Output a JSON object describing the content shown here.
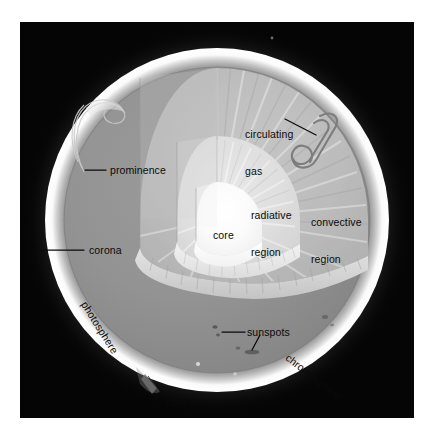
{
  "figure": {
    "background_color": "#050505",
    "page_color": "#ffffff",
    "corona_glow_color": "#f2f2f2",
    "photosphere_color": "#8e8e8e",
    "convective_color": "#b9b9b9",
    "radiative_color": "#dedede",
    "core_color": "#fbfbfb",
    "ledge_color": "#d2d2d2",
    "label_color": "#0a0a0a",
    "leader_color": "#0a0a0a"
  },
  "labels": {
    "circulating_gas": {
      "line1": "circulating",
      "line2": "gas",
      "x": 225,
      "y": 88,
      "rotation": 0
    },
    "prominence": {
      "text": "prominence",
      "x": 88,
      "y": 143,
      "rotation": 0
    },
    "corona": {
      "text": "corona",
      "x": 67,
      "y": 224,
      "rotation": 0
    },
    "radiative_region": {
      "line1": "radiative",
      "line2": "region",
      "x": 248,
      "y": 170,
      "rotation": 0
    },
    "convective_region": {
      "line1": "convective",
      "line2": "region",
      "x": 311,
      "y": 180,
      "rotation": 0
    },
    "core": {
      "text": "core",
      "x": 213,
      "y": 213,
      "rotation": 0
    },
    "sunspots": {
      "text": "sunspots",
      "x": 228,
      "y": 306,
      "rotation": 0
    },
    "photosphere": {
      "text": "photosphere",
      "x": 80,
      "y": 291,
      "rotation": 58
    },
    "chromosphere": {
      "text": "chromosphere",
      "x": 291,
      "y": 338,
      "rotation": 38
    },
    "flare": {
      "text": "flare",
      "x": 163,
      "y": 381,
      "rotation": 0
    }
  },
  "regions": [
    {
      "name": "corona",
      "description": "outer diffuse white glow beyond the limb"
    },
    {
      "name": "chromosphere",
      "description": "bright rim just above the photosphere"
    },
    {
      "name": "photosphere",
      "description": "visible grey surface of the sun"
    },
    {
      "name": "convective region",
      "description": "mid grey wedge with radial striations"
    },
    {
      "name": "radiative region",
      "description": "light grey dome inside the convective zone"
    },
    {
      "name": "core",
      "description": "brightest innermost dome"
    }
  ],
  "features": [
    {
      "name": "prominence",
      "description": "arching loop of gas on the left limb"
    },
    {
      "name": "flare",
      "description": "small eruption spike on the lower-left limb"
    },
    {
      "name": "sunspots",
      "description": "dark blemishes on the photosphere"
    },
    {
      "name": "circulating gas",
      "description": "looping convection cell outline"
    }
  ]
}
